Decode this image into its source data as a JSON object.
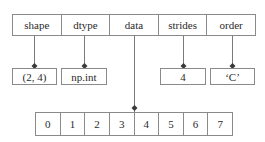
{
  "diagram": {
    "header_fields": [
      {
        "key": "shape",
        "label": "shape"
      },
      {
        "key": "dtype",
        "label": "dtype"
      },
      {
        "key": "data",
        "label": "data"
      },
      {
        "key": "strides",
        "label": "strides"
      },
      {
        "key": "order",
        "label": "order"
      }
    ],
    "values": {
      "shape": "(2, 4)",
      "dtype": "np.int",
      "strides": "4",
      "order": "‘C’"
    },
    "data_buffer": [
      "0",
      "1",
      "2",
      "3",
      "4",
      "5",
      "6",
      "7"
    ],
    "colors": {
      "line": "#8a8a8a",
      "connector": "#7a7a7a",
      "marker": "#3a3a3a",
      "text": "#2a2a2a",
      "background": "#ffffff"
    }
  }
}
